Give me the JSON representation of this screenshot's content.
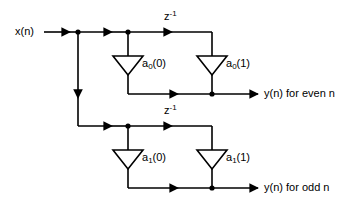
{
  "diagram": {
    "type": "signal-flow-graph",
    "background_color": "#ffffff",
    "line_color": "#000000",
    "input": {
      "label": "x(n)"
    },
    "outputs": [
      {
        "id": "even",
        "label": "y(n) for even n"
      },
      {
        "id": "odd",
        "label": "y(n) for odd n"
      }
    ],
    "delays": [
      {
        "id": "delay-top",
        "base": "z",
        "exponent": "-1"
      },
      {
        "id": "delay-bottom",
        "base": "z",
        "exponent": "-1"
      }
    ],
    "coefficients": [
      {
        "id": "a0-0",
        "base": "a",
        "sub": "0",
        "arg": "(0)"
      },
      {
        "id": "a0-1",
        "base": "a",
        "sub": "0",
        "arg": "(1)"
      },
      {
        "id": "a1-0",
        "base": "a",
        "sub": "1",
        "arg": "(0)"
      },
      {
        "id": "a1-1",
        "base": "a",
        "sub": "1",
        "arg": "(1)"
      }
    ],
    "branches": [
      {
        "id": "branch-even",
        "coefficients": [
          "a0-0",
          "a0-1"
        ],
        "delay": "delay-top",
        "output": "even"
      },
      {
        "id": "branch-odd",
        "coefficients": [
          "a1-0",
          "a1-1"
        ],
        "delay": "delay-bottom",
        "output": "odd"
      }
    ]
  }
}
